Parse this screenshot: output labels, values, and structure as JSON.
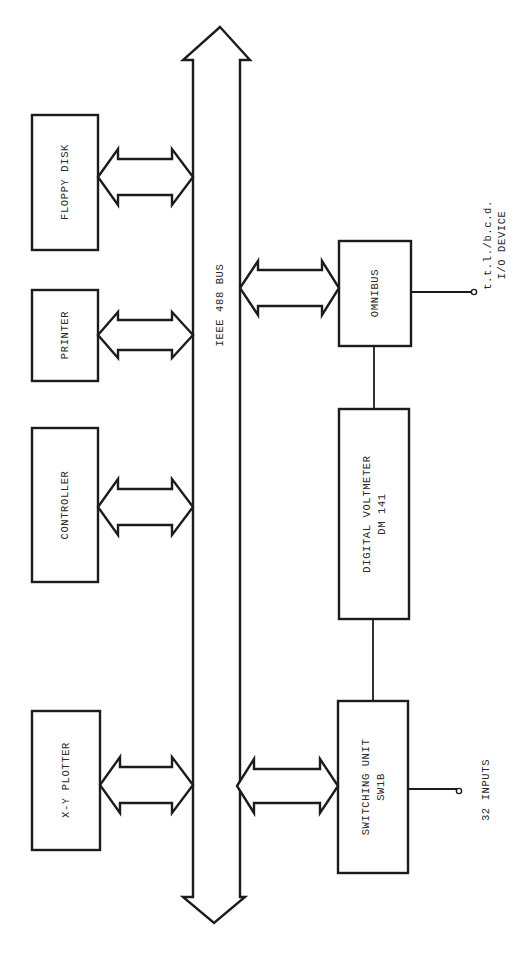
{
  "diagram": {
    "bus": {
      "label": "IEEE 488 BUS"
    },
    "left_devices": [
      {
        "id": "floppy",
        "label": "FLOPPY DISK"
      },
      {
        "id": "printer",
        "label": "PRINTER"
      },
      {
        "id": "controller",
        "label": "CONTROLLER"
      },
      {
        "id": "plotter",
        "label": "X-Y PLOTTER"
      }
    ],
    "right_devices": [
      {
        "id": "omnibus",
        "label": "OMNIBUS"
      },
      {
        "id": "dvm",
        "label": "DIGITAL VOLTMETER",
        "sublabel": "DM 141"
      },
      {
        "id": "switching",
        "label": "SWITCHING UNIT",
        "sublabel": "SW1B"
      }
    ],
    "terminals": {
      "omnibus_output_line1": "t.t.l./b.c.d.",
      "omnibus_output_line2": "I/O DEVICE",
      "switching_input": "32 INPUTS"
    }
  }
}
